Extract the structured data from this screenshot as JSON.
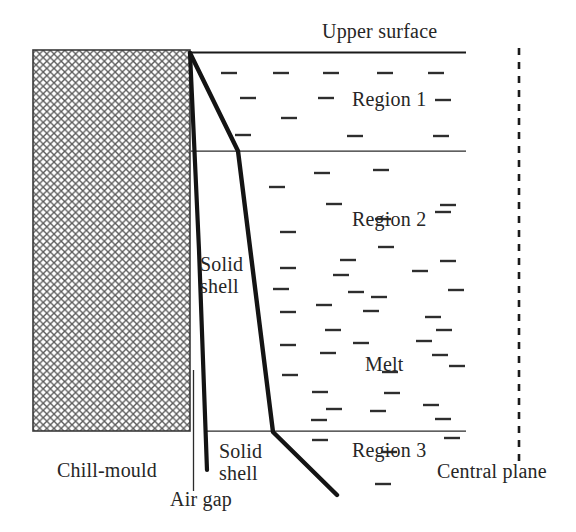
{
  "figure": {
    "type": "schematic-diagram",
    "width": 576,
    "height": 532,
    "background_color": "#ffffff",
    "line_color": "#1a1a1a",
    "hatch_color": "#555555",
    "text_color": "#262626"
  },
  "labels": {
    "upper_surface": "Upper surface",
    "region_1": "Region 1",
    "region_2": "Region 2",
    "melt": "Melt",
    "region_3": "Region 3",
    "central_plane": "Central plane",
    "chill_mould": "Chill-mould",
    "air_gap": "Air gap",
    "solid_shell_upper_line1": "Solid",
    "solid_shell_upper_line2": "shell",
    "solid_shell_lower_line1": "Solid",
    "solid_shell_lower_line2": "shell"
  },
  "geometry": {
    "mould": {
      "x": 33,
      "y": 50,
      "width": 157,
      "height": 381,
      "fill": "cross-hatch"
    },
    "upper_surface_line": {
      "x1": 190,
      "y1": 52,
      "x2": 466,
      "y2": 52
    },
    "region_1_2_boundary": {
      "x1": 191,
      "y1": 151,
      "x2": 466,
      "y2": 151
    },
    "region_2_3_boundary": {
      "x1": 207,
      "y1": 431,
      "x2": 466,
      "y2": 431
    },
    "central_plane_dashed": {
      "x": 519,
      "y1": 48,
      "y2": 466,
      "dash": "6 7"
    },
    "air_gap_line": {
      "x": 193,
      "y1": 370,
      "y2": 491
    },
    "solidification_front": [
      [
        190,
        53
      ],
      [
        238,
        151
      ],
      [
        273,
        432
      ],
      [
        337,
        495
      ]
    ],
    "shell_inner_edge": [
      [
        190,
        53
      ],
      [
        199,
        250
      ],
      [
        207,
        470
      ]
    ]
  },
  "melt_marks": [
    [
      229,
      73
    ],
    [
      281,
      73
    ],
    [
      331,
      73
    ],
    [
      385,
      73
    ],
    [
      436,
      73
    ],
    [
      248,
      98
    ],
    [
      326,
      98
    ],
    [
      443,
      100
    ],
    [
      289,
      118
    ],
    [
      243,
      135
    ],
    [
      355,
      136
    ],
    [
      441,
      136
    ],
    [
      322,
      173
    ],
    [
      381,
      170
    ],
    [
      277,
      187
    ],
    [
      334,
      204
    ],
    [
      448,
      205
    ],
    [
      383,
      219
    ],
    [
      443,
      212
    ],
    [
      288,
      232
    ],
    [
      386,
      247
    ],
    [
      348,
      260
    ],
    [
      448,
      261
    ],
    [
      288,
      268
    ],
    [
      341,
      275
    ],
    [
      420,
      271
    ],
    [
      281,
      289
    ],
    [
      356,
      292
    ],
    [
      456,
      290
    ],
    [
      324,
      305
    ],
    [
      379,
      297
    ],
    [
      288,
      312
    ],
    [
      371,
      311
    ],
    [
      433,
      317
    ],
    [
      333,
      330
    ],
    [
      444,
      330
    ],
    [
      288,
      345
    ],
    [
      361,
      343
    ],
    [
      424,
      341
    ],
    [
      328,
      353
    ],
    [
      440,
      355
    ],
    [
      290,
      375
    ],
    [
      390,
      372
    ],
    [
      457,
      366
    ],
    [
      320,
      392
    ],
    [
      392,
      393
    ],
    [
      334,
      409
    ],
    [
      378,
      411
    ],
    [
      431,
      405
    ],
    [
      319,
      420
    ],
    [
      443,
      419
    ],
    [
      320,
      440
    ],
    [
      452,
      438
    ],
    [
      389,
      452
    ],
    [
      383,
      484
    ]
  ]
}
